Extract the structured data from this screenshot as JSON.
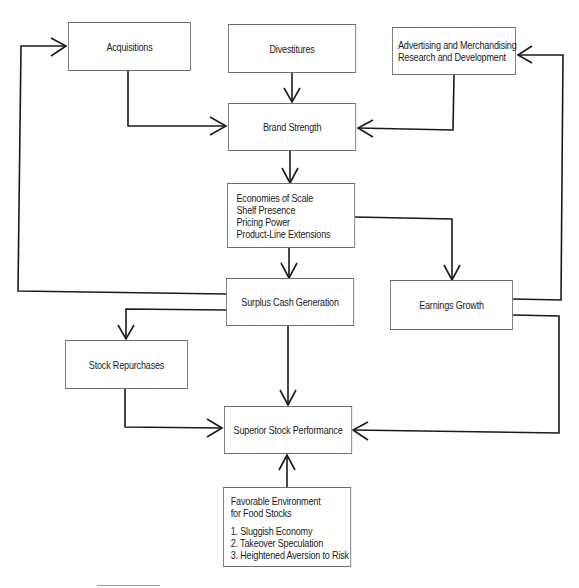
{
  "diagram": {
    "nodes": {
      "acquisitions": {
        "label": "Acquisitions"
      },
      "divestitures": {
        "label": "Divestitures"
      },
      "advertising": {
        "lines": [
          "Advertising and Merchandising",
          "Research and Development"
        ]
      },
      "brand_strength": {
        "label": "Brand Strength"
      },
      "economies": {
        "lines": [
          "Economies of Scale",
          "Shelf Presence",
          "Pricing Power",
          "Product-Line Extensions"
        ]
      },
      "surplus_cash": {
        "label": "Surplus Cash Generation"
      },
      "earnings_growth": {
        "label": "Earnings Growth"
      },
      "stock_repurchases": {
        "label": "Stock Repurchases"
      },
      "superior_performance": {
        "label": "Superior Stock Performance"
      },
      "favorable_environment": {
        "title_lines": [
          "Favorable Environment",
          "for Food Stocks"
        ],
        "items": [
          "1.  Sluggish Economy",
          "2.  Takeover Speculation",
          "3.  Heightened Aversion to Risk"
        ]
      }
    },
    "edges": [
      {
        "from": "Acquisitions",
        "to": "Brand Strength"
      },
      {
        "from": "Divestitures",
        "to": "Brand Strength"
      },
      {
        "from": "Advertising and Merchandising / Research and Development",
        "to": "Brand Strength"
      },
      {
        "from": "Brand Strength",
        "to": "Economies of Scale..."
      },
      {
        "from": "Economies of Scale...",
        "to": "Surplus Cash Generation"
      },
      {
        "from": "Economies of Scale...",
        "to": "Earnings Growth"
      },
      {
        "from": "Surplus Cash Generation",
        "to": "Acquisitions"
      },
      {
        "from": "Surplus Cash Generation",
        "to": "Stock Repurchases"
      },
      {
        "from": "Surplus Cash Generation",
        "to": "Superior Stock Performance"
      },
      {
        "from": "Earnings Growth",
        "to": "Advertising and Merchandising / Research and Development"
      },
      {
        "from": "Earnings Growth",
        "to": "Superior Stock Performance"
      },
      {
        "from": "Stock Repurchases",
        "to": "Superior Stock Performance"
      },
      {
        "from": "Favorable Environment for Food Stocks",
        "to": "Superior Stock Performance"
      }
    ],
    "colors": {
      "line": "#1a1a1a",
      "box_border": "#6e6e6e",
      "background": "#ffffff"
    }
  }
}
